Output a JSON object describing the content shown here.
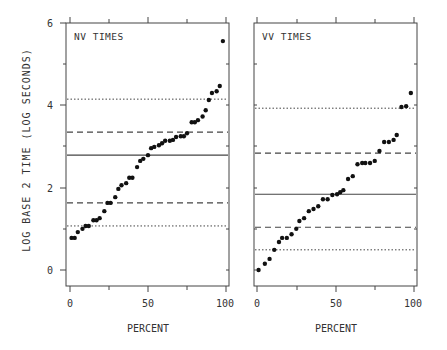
{
  "chart_data": {
    "type": "scatter",
    "ylabel": "LOG BASE 2 TIME (LOG SECONDS)",
    "xlabel": "PERCENT",
    "ylim": [
      0,
      6
    ],
    "xlim": [
      0,
      100
    ],
    "yticks": [
      0,
      2,
      4,
      6
    ],
    "xticks": [
      0,
      50,
      100
    ],
    "grid": false,
    "panels": [
      {
        "title": "NV TIMES",
        "x": [
          1,
          3,
          5,
          8,
          10,
          12,
          15,
          17,
          19,
          22,
          24,
          26,
          29,
          31,
          33,
          36,
          38,
          40,
          43,
          45,
          47,
          50,
          52,
          54,
          57,
          59,
          61,
          64,
          66,
          68,
          71,
          73,
          75,
          78,
          80,
          82,
          85,
          87,
          89,
          91,
          94,
          96,
          98
        ],
        "y": [
          0.78,
          0.78,
          0.92,
          1.0,
          1.07,
          1.07,
          1.21,
          1.21,
          1.26,
          1.43,
          1.63,
          1.63,
          1.77,
          1.97,
          2.06,
          2.11,
          2.24,
          2.24,
          2.5,
          2.65,
          2.7,
          2.79,
          2.96,
          2.99,
          3.03,
          3.08,
          3.14,
          3.14,
          3.16,
          3.23,
          3.25,
          3.25,
          3.32,
          3.59,
          3.59,
          3.64,
          3.73,
          3.88,
          4.13,
          4.3,
          4.34,
          4.47,
          5.56
        ],
        "lines": [
          {
            "style": "solid",
            "y": 2.79
          },
          {
            "style": "dashed",
            "y": 3.35
          },
          {
            "style": "dashed",
            "y": 1.63
          },
          {
            "style": "dotted",
            "y": 4.15
          },
          {
            "style": "dotted",
            "y": 1.07
          }
        ]
      },
      {
        "title": "VV TIMES",
        "x": [
          1,
          5,
          8,
          11,
          14,
          16,
          19,
          22,
          25,
          27,
          30,
          33,
          36,
          39,
          42,
          45,
          48,
          51,
          53,
          55,
          58,
          61,
          64,
          67,
          69,
          72,
          75,
          78,
          81,
          84,
          87,
          89,
          92,
          95,
          98
        ],
        "y": [
          0,
          0.15,
          0.27,
          0.49,
          0.68,
          0.78,
          0.78,
          0.87,
          1.0,
          1.19,
          1.26,
          1.43,
          1.48,
          1.55,
          1.72,
          1.72,
          1.82,
          1.84,
          1.89,
          1.94,
          2.21,
          2.28,
          2.57,
          2.6,
          2.6,
          2.6,
          2.65,
          2.89,
          3.11,
          3.11,
          3.16,
          3.28,
          3.96,
          3.98,
          4.3
        ],
        "lines": [
          {
            "style": "solid",
            "y": 1.84
          },
          {
            "style": "dashed",
            "y": 2.84
          },
          {
            "style": "dashed",
            "y": 1.04
          },
          {
            "style": "dotted",
            "y": 3.93
          },
          {
            "style": "dotted",
            "y": 0.49
          }
        ]
      }
    ]
  },
  "labels": {
    "ylabel": "LOG BASE 2 TIME (LOG SECONDS)",
    "xlabel_left": "PERCENT",
    "xlabel_right": "PERCENT",
    "title_left": "NV TIMES",
    "title_right": "VV TIMES",
    "ytick_6": "6",
    "ytick_4": "4",
    "ytick_2": "2",
    "ytick_0": "0",
    "xtick_0": "0",
    "xtick_50": "50",
    "xtick_100": "100"
  }
}
